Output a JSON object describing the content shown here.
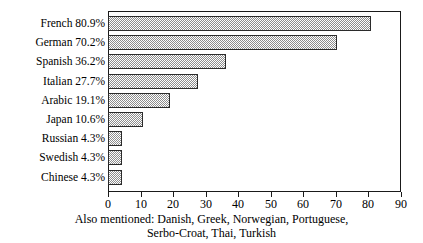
{
  "chart_data": {
    "type": "bar",
    "orientation": "horizontal",
    "title": "",
    "xlabel": "",
    "ylabel": "",
    "xlim": [
      0,
      90
    ],
    "xticks": [
      0,
      10,
      20,
      30,
      40,
      50,
      60,
      70,
      80,
      90
    ],
    "grid": false,
    "legend": false,
    "categories": [
      "French",
      "German",
      "Spanish",
      "Italian",
      "Arabic",
      "Japan",
      "Russian",
      "Swedish",
      "Chinese"
    ],
    "values": [
      80.9,
      70.2,
      36.2,
      27.7,
      19.1,
      10.6,
      4.3,
      4.3,
      4.3
    ],
    "value_suffix": "%",
    "rows": [
      {
        "label": "French 80.9%",
        "name": "French",
        "value": 80.9
      },
      {
        "label": "German 70.2%",
        "name": "German",
        "value": 70.2
      },
      {
        "label": "Spanish 36.2%",
        "name": "Spanish",
        "value": 36.2
      },
      {
        "label": "Italian 27.7%",
        "name": "Italian",
        "value": 27.7
      },
      {
        "label": "Arabic 19.1%",
        "name": "Arabic",
        "value": 19.1
      },
      {
        "label": "Japan 10.6%",
        "name": "Japan",
        "value": 10.6
      },
      {
        "label": "Russian 4.3%",
        "name": "Russian",
        "value": 4.3
      },
      {
        "label": "Swedish 4.3%",
        "name": "Swedish",
        "value": 4.3
      },
      {
        "label": "Chinese 4.3%",
        "name": "Chinese",
        "value": 4.3
      }
    ],
    "tick_labels": [
      "0",
      "10",
      "20",
      "30",
      "40",
      "50",
      "60",
      "70",
      "80",
      "90"
    ],
    "annotations": [
      "Also mentioned: Danish, Greek, Norwegian, Portuguese,",
      "Serbo-Croat, Thai, Turkish"
    ],
    "colors": {
      "bar_fill": "#8d8d8d",
      "bar_edge": "#2b2b2b",
      "axis": "#1a1a1a",
      "text": "#000000",
      "background": "#ffffff"
    }
  }
}
